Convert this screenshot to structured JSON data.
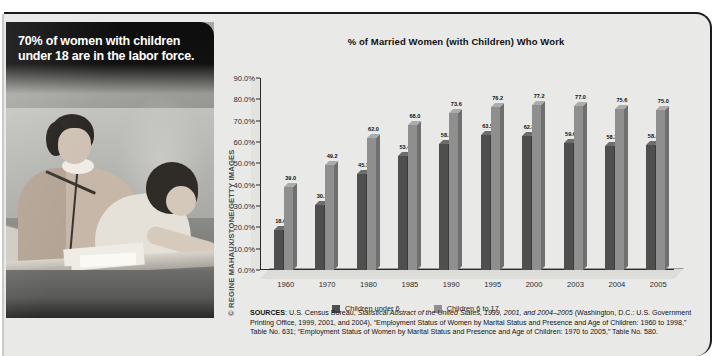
{
  "photo": {
    "headline": "70% of women with children under 18 are in the labor force.",
    "credit": "© REGINE MAHAUX/STONE/GETTY IMAGES"
  },
  "chart_data": {
    "type": "bar",
    "title": "% of Married Women (with Children) Who Work",
    "xlabel": "",
    "ylabel": "",
    "ylim": [
      0,
      90
    ],
    "ytick_labels": [
      "0.0%",
      "10.0%",
      "20.0%",
      "30.0%",
      "40.0%",
      "50.0%",
      "60.0%",
      "70.0%",
      "80.0%",
      "90.0%"
    ],
    "ytick_values": [
      0,
      10,
      20,
      30,
      40,
      50,
      60,
      70,
      80,
      90
    ],
    "grid": false,
    "legend_position": "bottom",
    "categories": [
      "1960",
      "1970",
      "1980",
      "1985",
      "1990",
      "1995",
      "2000",
      "2003",
      "2004",
      "2005"
    ],
    "series": [
      {
        "name": "Children under 6",
        "color": "#4f4f4f",
        "values": [
          18.6,
          30.3,
          45.1,
          53.4,
          58.9,
          63.5,
          62.8,
          59.6,
          58.3,
          58.8
        ],
        "labels": [
          "18.6",
          "30.3",
          "45.1",
          "53.4",
          "58.9",
          "63.5",
          "62.8",
          "59.6",
          "58.3",
          "58.8"
        ]
      },
      {
        "name": "Children 6 to 17",
        "color": "#8f8f8f",
        "values": [
          39.0,
          49.2,
          62.0,
          68.0,
          73.6,
          76.2,
          77.2,
          77.0,
          75.6,
          75.0
        ],
        "labels": [
          "39.0",
          "49.2",
          "62.0",
          "68.0",
          "73.6",
          "76.2",
          "77.2",
          "77.0",
          "75.6",
          "75.0"
        ]
      }
    ]
  },
  "sources": {
    "label": "SOURCES",
    "text_1": ": U.S. Census Bureau, ",
    "italic_1": "Statistical Abstract of the United States, 1999, 2001, and 2004–2005",
    "text_2": " (Washington, D.C.: U.S. Government Printing Office, 1999, 2001, and 2004), “Employment Status of Women by Marital Status and Presence and Age of Children: 1960 to 1998,” Table No. 631; “Employment Status of Women by Marital Status and Presence and Age of Children: 1970 to 2005,” Table No. 580."
  }
}
